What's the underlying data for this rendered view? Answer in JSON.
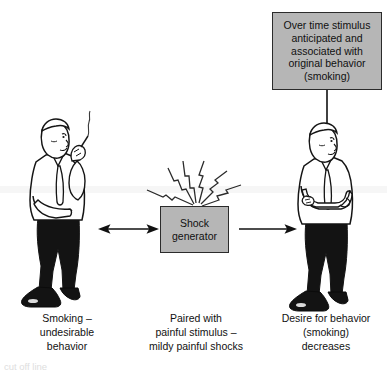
{
  "figure": {
    "type": "psychology-aversion-therapy-diagram",
    "boxes": {
      "stimulus": {
        "text": "Over time stimulus\nanticipated and\nassociated with\noriginal behavior\n(smoking)",
        "fill": "#b6b6b6",
        "border": "#2b2b2b"
      },
      "shock": {
        "text": "Shock\ngenerator",
        "fill": "#b6b6b6",
        "border": "#2b2b2b"
      }
    },
    "captions": {
      "left": "Smoking –\nundesirable\nbehavior",
      "middle": "Paired with\npainful stimulus –\nmildy painful shocks",
      "right": "Desire for behavior\n(smoking)\ndecreases"
    },
    "people": {
      "left": {
        "description": "man-smoking-cigarette",
        "shirt": "#ffffff",
        "trousers": "#111111",
        "shoes": "#111111"
      },
      "right": {
        "description": "man-arms-crossed",
        "shirt": "#ffffff",
        "trousers": "#111111",
        "shoes": "#111111"
      }
    },
    "arrows": {
      "left_double": "double-headed-arrow",
      "right_single": "single-headed-arrow",
      "vertical_down": "downward-arrow"
    },
    "sparks": {
      "count": 5,
      "description": "lightning-bolt-rays"
    },
    "bottom_clipped_text": "cut off line"
  }
}
